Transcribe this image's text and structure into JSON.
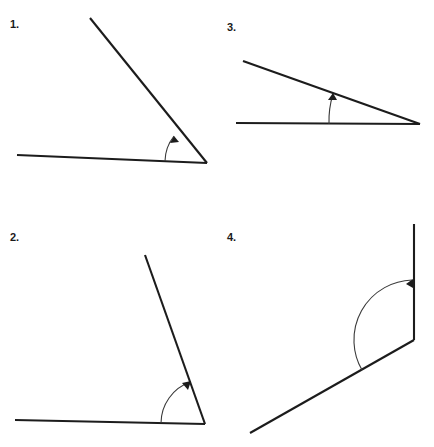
{
  "page": {
    "background_color": "#ffffff",
    "line_color": "#1c1c1c",
    "arc_color": "#3a3a3a",
    "width": 434,
    "height": 447
  },
  "figures": [
    {
      "id": "figure-1",
      "label": "1.",
      "position": "top-left",
      "angle_type": "acute",
      "approx_degrees": 43,
      "vertex": {
        "x": 207,
        "y": 163
      },
      "rays": [
        {
          "name": "horizontal-ray",
          "to": {
            "x": 17,
            "y": 155
          }
        },
        {
          "name": "slanted-ray",
          "to": {
            "x": 90,
            "y": 18
          }
        }
      ],
      "arc": {
        "radius": 42,
        "arrow_on": "slanted-ray"
      }
    },
    {
      "id": "figure-2",
      "label": "2.",
      "position": "bottom-left",
      "angle_type": "acute",
      "approx_degrees": 70,
      "vertex": {
        "x": 205,
        "y": 424
      },
      "rays": [
        {
          "name": "horizontal-ray",
          "to": {
            "x": 15,
            "y": 420
          }
        },
        {
          "name": "slanted-ray",
          "to": {
            "x": 145,
            "y": 255
          }
        }
      ],
      "arc": {
        "radius": 44,
        "arrow_on": "slanted-ray"
      }
    },
    {
      "id": "figure-3",
      "label": "3.",
      "position": "top-right",
      "angle_type": "acute",
      "approx_degrees": 19,
      "vertex": {
        "x": 420,
        "y": 124
      },
      "rays": [
        {
          "name": "horizontal-ray",
          "to": {
            "x": 236,
            "y": 123
          }
        },
        {
          "name": "slanted-ray",
          "to": {
            "x": 243,
            "y": 61
          }
        }
      ],
      "arc": {
        "radius": 91,
        "arrow_on": "slanted-ray"
      }
    },
    {
      "id": "figure-4",
      "label": "4.",
      "position": "bottom-right",
      "angle_type": "obtuse",
      "approx_degrees": 150,
      "vertex": {
        "x": 414,
        "y": 340
      },
      "rays": [
        {
          "name": "vertical-ray",
          "to": {
            "x": 414,
            "y": 153
          }
        },
        {
          "name": "slanted-ray",
          "to": {
            "x": 250,
            "y": 433
          }
        }
      ],
      "arc": {
        "radius": 60,
        "arrow_on": "vertical-ray"
      }
    }
  ]
}
